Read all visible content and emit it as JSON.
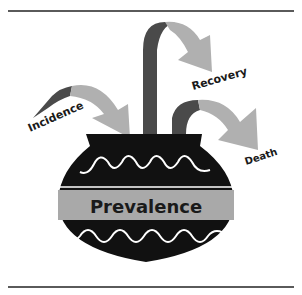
{
  "diagram": {
    "pot_label": "Prevalence",
    "flows": [
      {
        "label": "Incidence",
        "direction": "in"
      },
      {
        "label": "Recovery",
        "direction": "out"
      },
      {
        "label": "Death",
        "direction": "out"
      }
    ]
  },
  "colors": {
    "pot": "#111111",
    "band": "#a9a9a9",
    "arrow_dark": "#4a4a4a",
    "arrow_light": "#b0b0b0",
    "rule": "#5a5a5a"
  }
}
